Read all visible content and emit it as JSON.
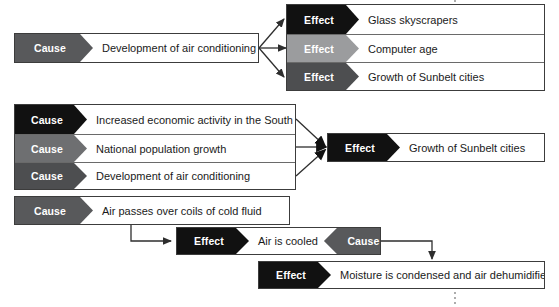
{
  "diagram": {
    "cause_label": "Cause",
    "effect_label": "Effect"
  },
  "groups": {
    "top": {
      "cause": {
        "tag": "Cause",
        "text": "Development of air conditioning",
        "tone": "#58595b"
      },
      "effects": [
        {
          "tag": "Effect",
          "text": "Glass skyscrapers",
          "tone": "#111111"
        },
        {
          "tag": "Effect",
          "text": "Computer age",
          "tone": "#9b9c9e"
        },
        {
          "tag": "Effect",
          "text": "Growth of Sunbelt cities",
          "tone": "#4d4e50"
        }
      ]
    },
    "middle": {
      "causes": [
        {
          "tag": "Cause",
          "text": "Increased economic activity in the South",
          "tone": "#111111"
        },
        {
          "tag": "Cause",
          "text": "National population growth",
          "tone": "#6e6f71"
        },
        {
          "tag": "Cause",
          "text": "Development of air conditioning",
          "tone": "#4d4e50"
        }
      ],
      "effect": {
        "tag": "Effect",
        "text": "Growth of Sunbelt cities",
        "tone": "#111111"
      }
    },
    "bottom": {
      "cause": {
        "tag": "Cause",
        "text": "Air passes over coils of cold fluid",
        "tone": "#58595b"
      },
      "chain": {
        "effect_tag": "Effect",
        "text": "Air is cooled",
        "effect_tone": "#111111",
        "cause_tag": "Cause",
        "cause_tone": "#58595b"
      },
      "final_effect": {
        "tag": "Effect",
        "text": "Moisture is condensed and air dehumidified",
        "tone": "#111111"
      }
    }
  },
  "connectors": {
    "top_fan_count": 3,
    "middle_fan_count": 3,
    "bottom_elbow": "cause-to-effect",
    "bottom_elbow_2": "cause-to-final-effect",
    "dotted_guides": 2
  },
  "colors": {
    "page_background": "#ffffff",
    "border": "#3c3c3c",
    "text": "#1a1a1a",
    "tab_text": "#ffffff",
    "connector": "#3c3c3c",
    "dotted": "#8a8a8a"
  }
}
